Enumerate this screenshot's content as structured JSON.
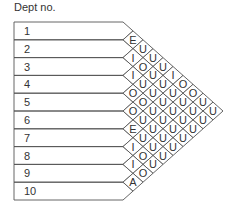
{
  "header": {
    "title": "Dept no."
  },
  "departments": [
    "1",
    "2",
    "3",
    "4",
    "5",
    "6",
    "7",
    "8",
    "9",
    "10"
  ],
  "colors": {
    "line": "#555555",
    "text": "#333333"
  },
  "chart_data": {
    "type": "table",
    "title": "Dept no.",
    "departments": [
      1,
      2,
      3,
      4,
      5,
      6,
      7,
      8,
      9,
      10
    ],
    "relationships": [
      {
        "pair": [
          1,
          2
        ],
        "code": "E"
      },
      {
        "pair": [
          1,
          3
        ],
        "code": "U"
      },
      {
        "pair": [
          1,
          4
        ],
        "code": "U"
      },
      {
        "pair": [
          1,
          5
        ],
        "code": "U"
      },
      {
        "pair": [
          1,
          6
        ],
        "code": "I"
      },
      {
        "pair": [
          1,
          7
        ],
        "code": "O"
      },
      {
        "pair": [
          1,
          8
        ],
        "code": "O"
      },
      {
        "pair": [
          1,
          9
        ],
        "code": "U"
      },
      {
        "pair": [
          1,
          10
        ],
        "code": "U"
      },
      {
        "pair": [
          2,
          3
        ],
        "code": "I"
      },
      {
        "pair": [
          2,
          4
        ],
        "code": "O"
      },
      {
        "pair": [
          2,
          5
        ],
        "code": "U"
      },
      {
        "pair": [
          2,
          6
        ],
        "code": "U"
      },
      {
        "pair": [
          2,
          7
        ],
        "code": "U"
      },
      {
        "pair": [
          2,
          8
        ],
        "code": "U"
      },
      {
        "pair": [
          2,
          9
        ],
        "code": "U"
      },
      {
        "pair": [
          2,
          10
        ],
        "code": "U"
      },
      {
        "pair": [
          3,
          4
        ],
        "code": "I"
      },
      {
        "pair": [
          3,
          5
        ],
        "code": "U"
      },
      {
        "pair": [
          3,
          6
        ],
        "code": "U"
      },
      {
        "pair": [
          3,
          7
        ],
        "code": "U"
      },
      {
        "pair": [
          3,
          8
        ],
        "code": "U"
      },
      {
        "pair": [
          3,
          9
        ],
        "code": "U"
      },
      {
        "pair": [
          3,
          10
        ],
        "code": "U"
      },
      {
        "pair": [
          4,
          5
        ],
        "code": "O"
      },
      {
        "pair": [
          4,
          6
        ],
        "code": "O"
      },
      {
        "pair": [
          4,
          7
        ],
        "code": "U"
      },
      {
        "pair": [
          4,
          8
        ],
        "code": "U"
      },
      {
        "pair": [
          4,
          9
        ],
        "code": "U"
      },
      {
        "pair": [
          4,
          10
        ],
        "code": "U"
      },
      {
        "pair": [
          5,
          6
        ],
        "code": "O"
      },
      {
        "pair": [
          5,
          7
        ],
        "code": "U"
      },
      {
        "pair": [
          5,
          8
        ],
        "code": "U"
      },
      {
        "pair": [
          5,
          9
        ],
        "code": "U"
      },
      {
        "pair": [
          5,
          10
        ],
        "code": "U"
      },
      {
        "pair": [
          6,
          7
        ],
        "code": "E"
      },
      {
        "pair": [
          6,
          8
        ],
        "code": "U"
      },
      {
        "pair": [
          6,
          9
        ],
        "code": "U"
      },
      {
        "pair": [
          6,
          10
        ],
        "code": "U"
      },
      {
        "pair": [
          7,
          8
        ],
        "code": "I"
      },
      {
        "pair": [
          7,
          9
        ],
        "code": "O"
      },
      {
        "pair": [
          7,
          10
        ],
        "code": "U"
      },
      {
        "pair": [
          8,
          9
        ],
        "code": "I"
      },
      {
        "pair": [
          8,
          10
        ],
        "code": "O"
      },
      {
        "pair": [
          9,
          10
        ],
        "code": "A"
      }
    ]
  }
}
